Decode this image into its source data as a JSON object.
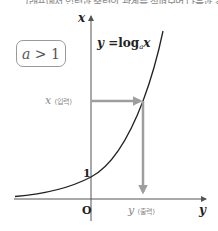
{
  "header_fragment": "그래프에서 입력과 출력의 관계를 살펴보면 다음과 같다",
  "condition": {
    "var": "a",
    "op": " > ",
    "value": "1"
  },
  "equation": {
    "lhs": "y",
    "eq": " =",
    "func": "log",
    "base": "a",
    "arg": "x"
  },
  "axes": {
    "vertical_label": "x",
    "horizontal_label": "y",
    "origin_label": "O",
    "intercept_label": "1"
  },
  "input_label": {
    "var": "x",
    "text": "(입력)"
  },
  "output_label": {
    "var": "y",
    "text": "(출력)"
  },
  "colors": {
    "axis": "#555555",
    "curve": "#222222",
    "arrow": "#9e9e9e",
    "box_border": "#9a9a9a",
    "io_text": "#888888"
  }
}
